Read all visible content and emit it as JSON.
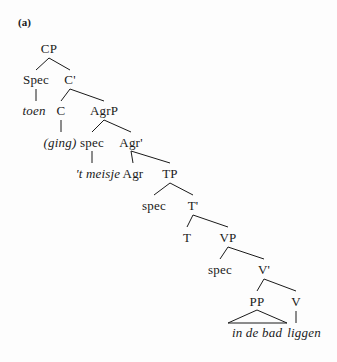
{
  "figure": {
    "label": "(a)",
    "label_pos": {
      "x": 18,
      "y": 17
    }
  },
  "tree": {
    "type": "syntax-tree",
    "language": "Dutch",
    "sentence": "toen (ging) 't meisje in de bad liggen",
    "nodes": [
      {
        "id": "cp",
        "text": "CP",
        "x": 49,
        "y": 42,
        "style": "roman",
        "kind": "category"
      },
      {
        "id": "spec-cp",
        "text": "Spec",
        "x": 36,
        "y": 73,
        "style": "roman",
        "kind": "category"
      },
      {
        "id": "cbar",
        "text": "C'",
        "x": 70,
        "y": 73,
        "style": "roman",
        "kind": "category"
      },
      {
        "id": "toen",
        "text": "toen",
        "x": 34,
        "y": 104,
        "style": "italic",
        "kind": "terminal"
      },
      {
        "id": "c",
        "text": "C",
        "x": 61,
        "y": 104,
        "style": "roman",
        "kind": "category"
      },
      {
        "id": "agrp",
        "text": "AgrP",
        "x": 104,
        "y": 104,
        "style": "roman",
        "kind": "category"
      },
      {
        "id": "ging",
        "text": "(ging)",
        "x": 60,
        "y": 136,
        "style": "italic",
        "kind": "terminal"
      },
      {
        "id": "spec-agrp",
        "text": "spec",
        "x": 92,
        "y": 136,
        "style": "roman",
        "kind": "category"
      },
      {
        "id": "agrbar",
        "text": "Agr'",
        "x": 131,
        "y": 136,
        "style": "roman",
        "kind": "category"
      },
      {
        "id": "tmeisje",
        "text": "'t meisje",
        "x": 98,
        "y": 167,
        "style": "italic",
        "kind": "terminal"
      },
      {
        "id": "agr",
        "text": "Agr",
        "x": 133,
        "y": 167,
        "style": "roman",
        "kind": "category"
      },
      {
        "id": "tp",
        "text": "TP",
        "x": 170,
        "y": 167,
        "style": "roman",
        "kind": "category"
      },
      {
        "id": "spec-tp",
        "text": "spec",
        "x": 154,
        "y": 199,
        "style": "roman",
        "kind": "category"
      },
      {
        "id": "tbar",
        "text": "T'",
        "x": 193,
        "y": 199,
        "style": "roman",
        "kind": "category"
      },
      {
        "id": "t",
        "text": "T",
        "x": 187,
        "y": 231,
        "style": "roman",
        "kind": "category"
      },
      {
        "id": "vp",
        "text": "VP",
        "x": 228,
        "y": 231,
        "style": "roman",
        "kind": "category"
      },
      {
        "id": "spec-vp",
        "text": "spec",
        "x": 220,
        "y": 263,
        "style": "roman",
        "kind": "category"
      },
      {
        "id": "vbar",
        "text": "V'",
        "x": 264,
        "y": 263,
        "style": "roman",
        "kind": "category"
      },
      {
        "id": "pp",
        "text": "PP",
        "x": 257,
        "y": 295,
        "style": "roman",
        "kind": "category"
      },
      {
        "id": "v",
        "text": "V",
        "x": 296,
        "y": 295,
        "style": "roman",
        "kind": "category"
      },
      {
        "id": "indebad",
        "text": "in de bad",
        "x": 257,
        "y": 326,
        "style": "italic",
        "kind": "terminal"
      },
      {
        "id": "liggen",
        "text": "liggen",
        "x": 304,
        "y": 326,
        "style": "italic",
        "kind": "terminal"
      }
    ],
    "branches": [
      {
        "from": "cp",
        "to": "spec-cp",
        "x1": 49,
        "y1": 58,
        "x2": 36,
        "y2": 70,
        "kind": "diagonal"
      },
      {
        "from": "cp",
        "to": "cbar",
        "x1": 49,
        "y1": 58,
        "x2": 70,
        "y2": 70,
        "kind": "diagonal"
      },
      {
        "from": "spec-cp",
        "to": "toen",
        "x1": 36,
        "y1": 89,
        "x2": 36,
        "y2": 101,
        "kind": "vertical"
      },
      {
        "from": "cbar",
        "to": "c",
        "x1": 70,
        "y1": 89,
        "x2": 61,
        "y2": 101,
        "kind": "diagonal"
      },
      {
        "from": "cbar",
        "to": "agrp",
        "x1": 70,
        "y1": 89,
        "x2": 104,
        "y2": 101,
        "kind": "diagonal"
      },
      {
        "from": "c",
        "to": "ging",
        "x1": 61,
        "y1": 120,
        "x2": 61,
        "y2": 132,
        "kind": "vertical"
      },
      {
        "from": "agrp",
        "to": "spec-agrp",
        "x1": 104,
        "y1": 120,
        "x2": 92,
        "y2": 132,
        "kind": "diagonal"
      },
      {
        "from": "agrp",
        "to": "agrbar",
        "x1": 104,
        "y1": 120,
        "x2": 131,
        "y2": 132,
        "kind": "diagonal"
      },
      {
        "from": "spec-agrp",
        "to": "tmeisje",
        "x1": 92,
        "y1": 151,
        "x2": 92,
        "y2": 163,
        "kind": "vertical"
      },
      {
        "from": "agrbar",
        "to": "agr",
        "x1": 131,
        "y1": 151,
        "x2": 133,
        "y2": 163,
        "kind": "diagonal"
      },
      {
        "from": "agrbar",
        "to": "tp",
        "x1": 131,
        "y1": 151,
        "x2": 170,
        "y2": 163,
        "kind": "diagonal"
      },
      {
        "from": "tp",
        "to": "spec-tp",
        "x1": 170,
        "y1": 183,
        "x2": 154,
        "y2": 195,
        "kind": "diagonal"
      },
      {
        "from": "tp",
        "to": "tbar",
        "x1": 170,
        "y1": 183,
        "x2": 193,
        "y2": 195,
        "kind": "diagonal"
      },
      {
        "from": "tbar",
        "to": "t",
        "x1": 193,
        "y1": 215,
        "x2": 187,
        "y2": 227,
        "kind": "diagonal"
      },
      {
        "from": "tbar",
        "to": "vp",
        "x1": 193,
        "y1": 215,
        "x2": 228,
        "y2": 227,
        "kind": "diagonal"
      },
      {
        "from": "vp",
        "to": "spec-vp",
        "x1": 228,
        "y1": 247,
        "x2": 220,
        "y2": 259,
        "kind": "diagonal"
      },
      {
        "from": "vp",
        "to": "vbar",
        "x1": 228,
        "y1": 247,
        "x2": 264,
        "y2": 259,
        "kind": "diagonal"
      },
      {
        "from": "vbar",
        "to": "pp",
        "x1": 264,
        "y1": 279,
        "x2": 257,
        "y2": 291,
        "kind": "diagonal"
      },
      {
        "from": "vbar",
        "to": "v",
        "x1": 264,
        "y1": 279,
        "x2": 296,
        "y2": 291,
        "kind": "diagonal"
      },
      {
        "from": "v",
        "to": "liggen",
        "x1": 296,
        "y1": 311,
        "x2": 296,
        "y2": 323,
        "kind": "vertical"
      }
    ],
    "triangles": [
      {
        "from": "pp",
        "to": "indebad",
        "apex_x": 257,
        "apex_y": 310,
        "left_x": 228,
        "right_x": 287,
        "base_y": 323
      }
    ]
  },
  "colors": {
    "ink": "#1a1a1a",
    "paper": "#fdfdfd"
  }
}
